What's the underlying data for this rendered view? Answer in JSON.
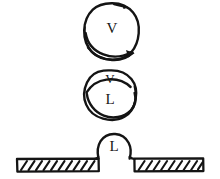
{
  "figure": {
    "title": "Vapor-liquid nucleation and wetting sequence",
    "background_color": "#ffffff",
    "ink_color": "#141414",
    "panels": [
      {
        "id": "vapor-bubble",
        "name": "vapor-bubble-panel",
        "label": "V",
        "label_meaning": "vapor",
        "description": "Hand-drawn round vapor blob with a curved circulation arrow sweeping across its lower portion and a small arrowhead at upper right.",
        "has_arrow": true,
        "arrow_count": 2
      },
      {
        "id": "vapor-liquid-bubble",
        "name": "vapor-liquid-bubble-panel",
        "labels": [
          "V",
          "L"
        ],
        "upper_label": "V",
        "lower_label": "L",
        "description": "Hand-drawn round blob divided by a curved meniscus line; vapor V occupies the thin upper cap, liquid L fills the lower body."
      },
      {
        "id": "liquid-droplet-on-substrate",
        "name": "droplet-on-substrate-panel",
        "label": "L",
        "label_meaning": "liquid",
        "description": "Hand-drawn liquid droplet resting as a dome on a horizontal hatched solid substrate.",
        "substrate": {
          "name": "hatched-substrate",
          "hatch_direction": "up-right",
          "segments": [
            "left",
            "right"
          ]
        }
      }
    ]
  }
}
